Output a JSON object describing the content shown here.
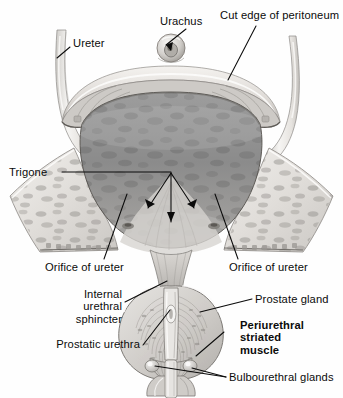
{
  "figure": {
    "style": "grayscale anatomical illustration",
    "colors": {
      "background": "#fefefe",
      "leader_line": "#0b0b0b",
      "label_text": "#0b0b0b",
      "bladder_cavity": "#8a8a8a",
      "bladder_wall_pale": "#e3e1de",
      "mucosa_mid": "#b9b7b4",
      "prostate_fill": "#d4d2cf",
      "ureter_tube": "#efedea",
      "shadow": "#6e6e6e"
    }
  },
  "labels": [
    {
      "id": "ureter",
      "text": "Ureter",
      "bold": false,
      "align": "left"
    },
    {
      "id": "urachus",
      "text": "Urachus",
      "bold": false,
      "align": "left"
    },
    {
      "id": "cut-edge-of-peritoneum",
      "text": "Cut edge of peritoneum",
      "bold": false,
      "align": "left"
    },
    {
      "id": "trigone",
      "text": "Trigone",
      "bold": false,
      "align": "left"
    },
    {
      "id": "orifice-of-ureter-left",
      "text": "Orifice of ureter",
      "bold": false,
      "align": "left"
    },
    {
      "id": "orifice-of-ureter-right",
      "text": "Orifice of ureter",
      "bold": false,
      "align": "left"
    },
    {
      "id": "internal-urethral-sphincter",
      "text": "Internal\nurethral\nsphincter",
      "bold": false,
      "align": "right"
    },
    {
      "id": "prostatic-urethra",
      "text": "Prostatic urethra",
      "bold": false,
      "align": "right"
    },
    {
      "id": "prostate-gland",
      "text": "Prostate gland",
      "bold": false,
      "align": "left"
    },
    {
      "id": "periurethral-striated-muscle",
      "text": "Periurethral\nstriated\nmuscle",
      "bold": true,
      "align": "left"
    },
    {
      "id": "bulbourethral-glands",
      "text": "Bulbourethral glands",
      "bold": false,
      "align": "left"
    }
  ],
  "structures": [
    "left ureter",
    "right ureter",
    "urachus",
    "cut edge of peritoneum",
    "bladder cavity with mottled mucosa",
    "trigone",
    "ureteric orifices",
    "internal urethral sphincter",
    "prostatic urethra",
    "prostate gland",
    "periurethral striated muscle",
    "bulbourethral glands"
  ]
}
